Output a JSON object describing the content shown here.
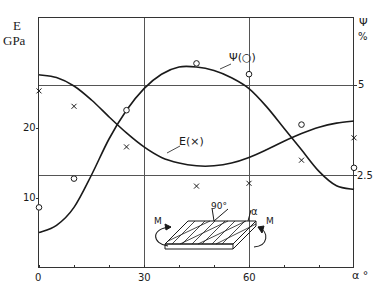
{
  "chart_data": {
    "type": "line",
    "title": "",
    "xlabel": "α °",
    "ylabel_left": "E GPa",
    "ylabel_right": "Ψ %",
    "xlim": [
      0,
      90
    ],
    "ylim_left": [
      0,
      36
    ],
    "ylim_right": [
      0,
      7.5
    ],
    "x_ticks": [
      0,
      30,
      60
    ],
    "x_tick_labels": [
      "0",
      "30",
      "60"
    ],
    "x_minor_ticks": [
      10,
      20,
      40,
      50,
      70,
      80
    ],
    "y_left_ticks": [
      10,
      20
    ],
    "y_right_ticks": [
      2.5,
      5
    ],
    "grid": {
      "vertical": [
        30,
        60
      ],
      "horizontal_right": [
        2.5,
        5
      ]
    },
    "series": [
      {
        "name": "E(×)",
        "axis": "left",
        "marker": "x",
        "points_x": [
          0,
          10,
          25,
          45,
          60,
          75,
          90
        ],
        "points_y": [
          25.3,
          23.1,
          17.3,
          11.7,
          12.1,
          15.4,
          18.6
        ],
        "curve_x": [
          0,
          5,
          10,
          15,
          20,
          25,
          30,
          35,
          40,
          45,
          50,
          55,
          60,
          65,
          70,
          75,
          80,
          85,
          90
        ],
        "curve_y": [
          27.6,
          27.2,
          26.0,
          24.0,
          21.6,
          19.3,
          17.3,
          15.8,
          15.0,
          14.6,
          14.6,
          15.0,
          15.8,
          16.9,
          18.1,
          19.2,
          20.1,
          20.7,
          21.0
        ]
      },
      {
        "name": "Ψ(○)",
        "axis": "right",
        "marker": "o",
        "points_x": [
          0,
          10,
          25,
          45,
          60,
          75,
          90
        ],
        "points_y": [
          1.6,
          2.4,
          4.3,
          5.6,
          5.3,
          3.9,
          2.7
        ],
        "curve_x": [
          0,
          5,
          10,
          15,
          20,
          25,
          30,
          35,
          40,
          45,
          50,
          55,
          60,
          65,
          70,
          75,
          80,
          85,
          90
        ],
        "curve_y": [
          0.9,
          1.1,
          1.6,
          2.5,
          3.5,
          4.3,
          4.9,
          5.3,
          5.5,
          5.5,
          5.4,
          5.2,
          4.9,
          4.4,
          3.8,
          3.2,
          2.6,
          2.2,
          2.1
        ]
      }
    ],
    "annotations": [
      "Ψ(○)",
      "E(×)",
      "90°",
      "α",
      "M",
      "M"
    ],
    "legend": "inline curve labels"
  },
  "labels": {
    "left_axis_title_line1": "E",
    "left_axis_title_line2": "GPa",
    "right_axis_title_line1": "Ψ",
    "right_axis_title_line2": "%",
    "left_tick_10": "10",
    "left_tick_20": "20",
    "right_tick_5": "5",
    "right_tick_2_5": "2.5",
    "x_tick_0": "0",
    "x_tick_30": "30",
    "x_tick_60": "60",
    "x_axis_title": "α °",
    "psi_curve_label": "Ψ(○)",
    "e_curve_label": "E(×)",
    "inset_angle_90": "90°",
    "inset_alpha": "α",
    "inset_moment_left": "M",
    "inset_moment_right": "M"
  },
  "colors": {
    "ink": "#1a1a1a",
    "grid": "#555555",
    "background": "#ffffff"
  }
}
